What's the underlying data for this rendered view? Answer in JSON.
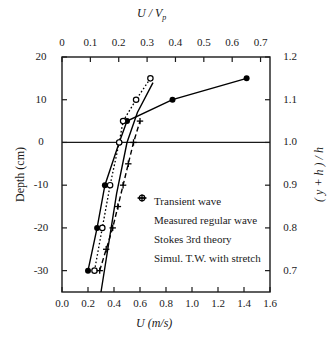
{
  "chart_data": {
    "type": "line",
    "title": "",
    "xlabel": "U (m/s)",
    "ylabel": "Depth (cm)",
    "x2label": "U / Vp",
    "y2label": "( y + h ) / h",
    "xlim": [
      0.0,
      1.6
    ],
    "ylim": [
      -35,
      20
    ],
    "x2lim": [
      0.0,
      0.7333
    ],
    "y2lim": [
      0.667,
      1.2
    ],
    "grid": false,
    "legend_position": "center-right-inside",
    "xticks": [
      "0.0",
      "0.2",
      "0.4",
      "0.6",
      "0.8",
      "1.0",
      "1.2",
      "1.4",
      "1.6"
    ],
    "xtick_values": [
      0.0,
      0.2,
      0.4,
      0.6,
      0.8,
      1.0,
      1.2,
      1.4,
      1.6
    ],
    "x2ticks": [
      "0",
      "0.1",
      "0.2",
      "0.3",
      "0.4",
      "0.5",
      "0.6",
      "0.7"
    ],
    "x2tick_values": [
      0.0,
      0.1,
      0.2,
      0.3,
      0.4,
      0.5,
      0.6,
      0.7
    ],
    "yticks": [
      "20",
      "10",
      "0",
      "-10",
      "-20",
      "-30"
    ],
    "ytick_values": [
      20,
      10,
      0,
      -10,
      -20,
      -30
    ],
    "y2ticks": [
      "1.2",
      "1.1",
      "1.0",
      "0.9",
      "0.8",
      "0.7"
    ],
    "y2tick_values": [
      1.2,
      1.1,
      1.0,
      0.9,
      0.8,
      0.7
    ],
    "series": [
      {
        "name": "Transient wave",
        "marker": "filled-circle",
        "line": "solid",
        "points": [
          {
            "u": 0.2,
            "depth": -30
          },
          {
            "u": 0.27,
            "depth": -20
          },
          {
            "u": 0.33,
            "depth": -10
          },
          {
            "u": 0.44,
            "depth": 0
          },
          {
            "u": 0.5,
            "depth": 5
          },
          {
            "u": 0.85,
            "depth": 10
          },
          {
            "u": 1.42,
            "depth": 15
          }
        ]
      },
      {
        "name": "Measured regular wave",
        "marker": "open-circle",
        "line": "dotted",
        "points": [
          {
            "u": 0.25,
            "depth": -30
          },
          {
            "u": 0.31,
            "depth": -20
          },
          {
            "u": 0.37,
            "depth": -10
          },
          {
            "u": 0.44,
            "depth": 0
          },
          {
            "u": 0.47,
            "depth": 5
          },
          {
            "u": 0.57,
            "depth": 10
          },
          {
            "u": 0.68,
            "depth": 15
          }
        ]
      },
      {
        "name": "Stokes 3rd theory",
        "marker": "plus",
        "line": "dashed",
        "points": [
          {
            "u": 0.29,
            "depth": -30
          },
          {
            "u": 0.34,
            "depth": -25
          },
          {
            "u": 0.39,
            "depth": -20
          },
          {
            "u": 0.43,
            "depth": -15
          },
          {
            "u": 0.47,
            "depth": -10
          },
          {
            "u": 0.51,
            "depth": -5
          },
          {
            "u": 0.55,
            "depth": 0
          },
          {
            "u": 0.6,
            "depth": 5
          }
        ]
      },
      {
        "name": "Simul. T.W. with stretch",
        "marker": "none",
        "line": "solid",
        "points": [
          {
            "u": 0.3,
            "depth": -35
          },
          {
            "u": 0.42,
            "depth": -12
          },
          {
            "u": 0.5,
            "depth": 0
          },
          {
            "u": 0.58,
            "depth": 7
          },
          {
            "u": 0.7,
            "depth": 14
          }
        ]
      }
    ],
    "legend": [
      {
        "marker": "filled-circle",
        "label": "Transient wave"
      },
      {
        "marker": "open-circle",
        "label": "Measured regular wave"
      },
      {
        "marker": "plus",
        "label": "Stokes 3rd theory"
      },
      {
        "marker": "dash",
        "label": "Simul. T.W. with stretch"
      }
    ],
    "colors": {
      "axis": "#1a1a1a",
      "data": "#000000",
      "background": "#ffffff"
    }
  }
}
